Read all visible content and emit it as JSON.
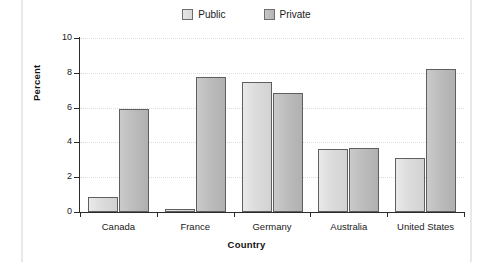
{
  "chart_data": {
    "type": "bar",
    "title": "",
    "subtitle": "",
    "xlabel": "Country",
    "ylabel": "Percent",
    "categories": [
      "Canada",
      "France",
      "Germany",
      "Australia",
      "United States"
    ],
    "series": [
      {
        "name": "Public",
        "values": [
          0.85,
          0.2,
          7.5,
          3.6,
          3.1
        ],
        "color": "#dcdcdc"
      },
      {
        "name": "Private",
        "values": [
          5.9,
          7.75,
          6.85,
          3.7,
          8.2
        ],
        "color": "#bdbdbd"
      }
    ],
    "ylim": [
      0,
      10
    ],
    "yticks": [
      0,
      2,
      4,
      6,
      8,
      10
    ],
    "ytick_labels": [
      "0",
      "2",
      "4",
      "6",
      "8",
      "10"
    ],
    "grid": true,
    "grid_axis": "y",
    "grid_style": "dotted",
    "legend_position": "top-center",
    "bar_edge_color": "#5f5f5f",
    "axis_color": "#2b2b2b",
    "background": "#ffffff"
  },
  "legend": {
    "items": [
      {
        "label": "Public",
        "swatch": "public-swatch"
      },
      {
        "label": "Private",
        "swatch": "private-swatch"
      }
    ]
  }
}
